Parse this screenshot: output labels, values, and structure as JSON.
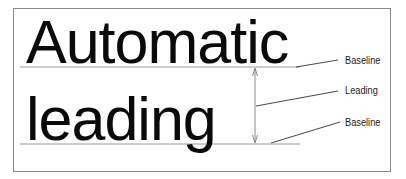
{
  "diagram": {
    "line1": "Automatic",
    "line2": "leading",
    "labels": {
      "baseline_top": "Baseline",
      "leading": "Leading",
      "baseline_bottom": "Baseline"
    },
    "colors": {
      "text": "#0a0a0a",
      "lines": "#8a8a8a",
      "border": "#8a8a8a",
      "background": "#ffffff"
    }
  }
}
